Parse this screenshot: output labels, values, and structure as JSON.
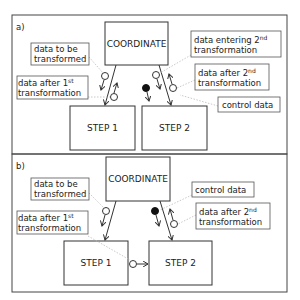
{
  "diagram": {
    "panels": [
      {
        "id": "a",
        "tag": "a)",
        "coordinator": "COORDINATE",
        "steps": [
          "STEP 1",
          "STEP 2"
        ],
        "labels": {
          "data_to_be_transformed": [
            "data to be",
            "transformed"
          ],
          "data_after_first": {
            "line1": "data after 1",
            "sup": "st",
            "line2": "transformation"
          },
          "data_entering_second": {
            "line1": "data entering 2",
            "sup": "nd",
            "line2": "transformation"
          },
          "data_after_second": {
            "line1": "data after 2",
            "sup": "nd",
            "line2": "transformation"
          },
          "control_data": "control data"
        }
      },
      {
        "id": "b",
        "tag": "b)",
        "coordinator": "COORDINATE",
        "steps": [
          "STEP 1",
          "STEP 2"
        ],
        "labels": {
          "data_to_be_transformed": [
            "data to be",
            "transformed"
          ],
          "data_after_first": {
            "line1": "data after 1",
            "sup": "st",
            "line2": "transformation"
          },
          "control_data": "control data",
          "data_after_second": {
            "line1": "data after 2",
            "sup": "nd",
            "line2": "transformation"
          }
        }
      }
    ],
    "legend_symbols": {
      "open_circle": "data couple",
      "filled_circle": "control couple"
    },
    "colors": {
      "line": "#333333",
      "leader": "#bbbbbb",
      "background": "#ffffff"
    }
  }
}
